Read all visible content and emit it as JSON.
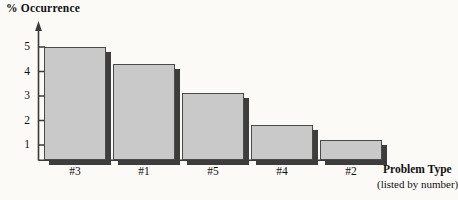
{
  "chart_data": {
    "type": "bar",
    "title": "",
    "ylabel": "% Occurrence",
    "xlabel": "Problem Type",
    "xlabel_note": "(listed by number)",
    "categories": [
      "#3",
      "#1",
      "#5",
      "#4",
      "#2"
    ],
    "values": [
      4.9,
      4.15,
      2.9,
      1.5,
      0.85
    ],
    "ytick_labels": [
      "1",
      "2",
      "3",
      "4",
      "5"
    ],
    "ytick_values": [
      1,
      2,
      3,
      4,
      5
    ],
    "ylim": [
      0,
      5.7
    ],
    "grid": false,
    "legend": null,
    "bar_fill_color": "#c9c9c9",
    "bar_edge_color": "#4a4a4a",
    "bar_shadow_color": "#3d3d3d",
    "axis_color": "#3a3a3a",
    "background_color": "#fbfaf7"
  }
}
